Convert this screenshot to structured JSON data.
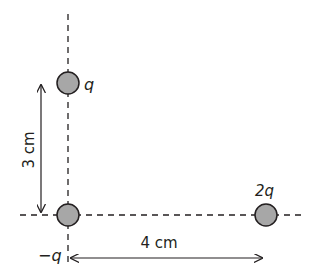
{
  "diagram": {
    "type": "point-charges-configuration",
    "colors": {
      "line": "#231f20",
      "charge_fill": "#a7a7a7",
      "charge_stroke": "#231f20",
      "background": "#ffffff"
    },
    "charges": [
      {
        "id": "charge-q",
        "label": "q",
        "cx": 68,
        "cy": 83,
        "r": 11,
        "label_x": 84,
        "label_y": 90
      },
      {
        "id": "charge-minus-q",
        "label": "−q",
        "cx": 68,
        "cy": 215,
        "r": 11,
        "label_x": 38,
        "label_y": 261
      },
      {
        "id": "charge-2q",
        "label": "2q",
        "cx": 266,
        "cy": 215,
        "r": 11,
        "label_x": 255,
        "label_y": 196
      }
    ],
    "dimensions": {
      "vertical": {
        "label": "3 cm",
        "x": 41,
        "y1": 84,
        "y2": 213
      },
      "horizontal": {
        "label": "4 cm",
        "y": 258,
        "x1": 70,
        "x2": 262
      }
    },
    "axes": {
      "vertical_dashed": {
        "x": 68,
        "y1": 14,
        "y2": 262
      },
      "horizontal_dashed": {
        "y": 215,
        "x1": 20,
        "x2": 302
      }
    }
  }
}
